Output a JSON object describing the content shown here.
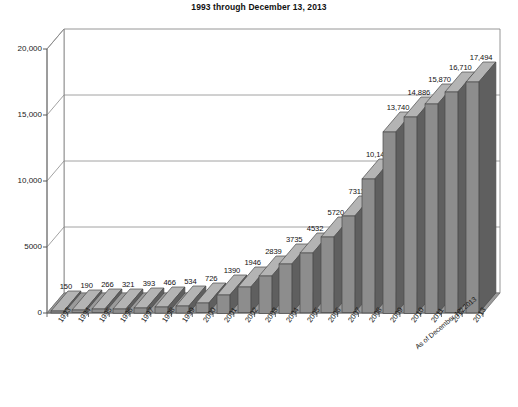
{
  "chart_data": {
    "type": "bar",
    "title": "1993 through December 13, 2013",
    "xlabel": "",
    "ylabel": "",
    "ylim": [
      0,
      20000
    ],
    "grid": true,
    "legend": false,
    "style": "3d-column-grayscale",
    "annotation": "As of December 13, 2013",
    "ytick_labels": [
      "0",
      "5000",
      "10,000",
      "15,000",
      "20,000"
    ],
    "ytick_values": [
      0,
      5000,
      10000,
      15000,
      20000
    ],
    "categories": [
      "1993",
      "1994",
      "1995",
      "1996",
      "1997",
      "1998",
      "1999",
      "2000",
      "2001",
      "2002",
      "2003",
      "2004",
      "2005",
      "2006",
      "2007",
      "2008",
      "2009",
      "2010",
      "2011",
      "2012",
      "2013"
    ],
    "values": [
      150,
      190,
      266,
      321,
      393,
      466,
      534,
      726,
      1390,
      1946,
      2839,
      3735,
      4532,
      5720,
      7311,
      10146,
      13740,
      14886,
      15870,
      16710,
      17494
    ],
    "value_labels": [
      "150",
      "190",
      "266",
      "321",
      "393",
      "466",
      "534",
      "726",
      "1390",
      "1946",
      "2839",
      "3735",
      "4532",
      "5720",
      "7311",
      "10,146",
      "13,740",
      "14,886",
      "15,870",
      "16,710",
      "17,494"
    ],
    "colors": {
      "bar_front": "#8d8d8d",
      "bar_side": "#5f5f5f",
      "bar_top": "#b4b4b4",
      "floor": "#8d8d8d",
      "frame": "#8a8a8a",
      "text": "#1a1a1a"
    }
  }
}
